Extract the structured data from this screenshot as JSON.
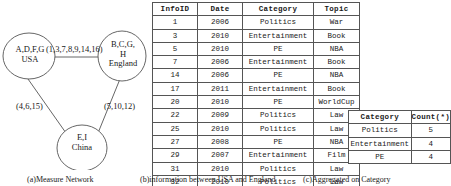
{
  "figure_a": {
    "caption": "(a)Measure Network",
    "nodes": [
      {
        "id": "usa",
        "line1": "A,D,F,G",
        "line2": "USA"
      },
      {
        "id": "england",
        "line1": "B,C,G,",
        "line2": "H",
        "line3": "England"
      },
      {
        "id": "china",
        "line1": "E,I",
        "line2": "China"
      }
    ],
    "edges": [
      {
        "id": "usa-england",
        "label": "(1,3,7,8,9,14,16)"
      },
      {
        "id": "usa-china",
        "label": "(4,6,15)"
      },
      {
        "id": "england-china",
        "label": "(5,10,12)"
      }
    ]
  },
  "figure_b": {
    "caption": "(b)information between USA and England",
    "columns": [
      "InfoID",
      "Date",
      "Category",
      "Topic"
    ],
    "rows": [
      [
        "1",
        "2006",
        "Politics",
        "War"
      ],
      [
        "3",
        "2010",
        "Entertainment",
        "Book"
      ],
      [
        "5",
        "2010",
        "PE",
        "NBA"
      ],
      [
        "7",
        "2006",
        "Entertainment",
        "Book"
      ],
      [
        "14",
        "2006",
        "PE",
        "NBA"
      ],
      [
        "17",
        "2011",
        "Entertainment",
        "Book"
      ],
      [
        "20",
        "2010",
        "PE",
        "WorldCup"
      ],
      [
        "22",
        "2009",
        "Politics",
        "Law"
      ],
      [
        "25",
        "2010",
        "Politics",
        "Law"
      ],
      [
        "27",
        "2008",
        "PE",
        "NBA"
      ],
      [
        "29",
        "2007",
        "Entertainment",
        "Film"
      ],
      [
        "31",
        "2010",
        "Politics",
        "Law"
      ],
      [
        "32",
        "2010",
        "Politics",
        "Law"
      ]
    ]
  },
  "figure_c": {
    "caption": "(c)Aggregated on Category",
    "columns": [
      "Category",
      "Count(*)"
    ],
    "rows": [
      [
        "Politics",
        "5"
      ],
      [
        "Entertainment",
        "4"
      ],
      [
        "PE",
        "4"
      ]
    ]
  },
  "colors": {
    "stroke": "#555555",
    "text": "#1a1a1a",
    "background": "#ffffff"
  }
}
